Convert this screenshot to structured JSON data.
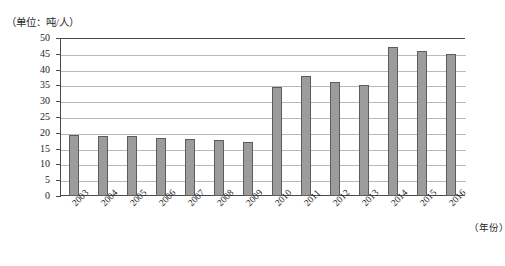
{
  "chart_data": {
    "type": "bar",
    "title": "",
    "unit_label": "（单位：吨/人）",
    "xlabel": "（年份）",
    "ylabel": "",
    "ylim": [
      0,
      50
    ],
    "ytick_step": 5,
    "yticks": [
      "0",
      "5",
      "10",
      "15",
      "20",
      "25",
      "30",
      "35",
      "40",
      "45",
      "50"
    ],
    "grid": true,
    "legend": "none",
    "categories": [
      "2003",
      "2004",
      "2005",
      "2006",
      "2007",
      "2008",
      "2009",
      "2010",
      "2011",
      "2012",
      "2013",
      "2014",
      "2015",
      "2016"
    ],
    "values": [
      19.3,
      19,
      19,
      18.5,
      18.1,
      17.8,
      17,
      34.5,
      38,
      36,
      35,
      47,
      46,
      45
    ]
  },
  "style": {
    "bar_fill": "#9c9c9c",
    "bar_stroke": "#5d5d5d",
    "axis_color": "#4a4a4a",
    "grid_color": "#b9b9b9",
    "text_color": "#242424",
    "background": "#ffffff"
  },
  "caption": ""
}
